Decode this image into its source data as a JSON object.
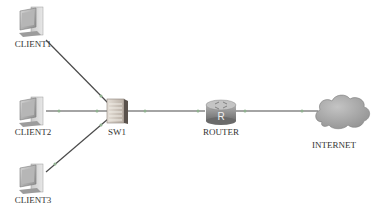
{
  "diagram": {
    "type": "network-topology",
    "nodes": [
      {
        "id": "client1",
        "label": "CLIENT1",
        "kind": "pc",
        "icon": "pc-icon"
      },
      {
        "id": "client2",
        "label": "CLIENT2",
        "kind": "pc",
        "icon": "pc-icon"
      },
      {
        "id": "client3",
        "label": "CLIENT3",
        "kind": "pc",
        "icon": "pc-icon"
      },
      {
        "id": "sw1",
        "label": "SW1",
        "kind": "switch",
        "icon": "switch-icon"
      },
      {
        "id": "router",
        "label": "ROUTER",
        "kind": "router",
        "icon": "router-icon"
      },
      {
        "id": "internet",
        "label": "INTERNET",
        "kind": "cloud",
        "icon": "cloud-icon"
      }
    ],
    "links": [
      {
        "from": "client1",
        "to": "sw1"
      },
      {
        "from": "client2",
        "to": "sw1"
      },
      {
        "from": "client3",
        "to": "sw1"
      },
      {
        "from": "sw1",
        "to": "router"
      },
      {
        "from": "router",
        "to": "internet"
      }
    ],
    "router_glyph": "R",
    "caption": "",
    "colors": {
      "link": "#4a4a4a",
      "link_dot": "#8fb08f",
      "pc_body": "#b8b8b8",
      "switch_body": "#c8c0b8",
      "router_body": "#8a8a8a",
      "cloud": "#a8a8a8",
      "label": "#333333"
    }
  }
}
